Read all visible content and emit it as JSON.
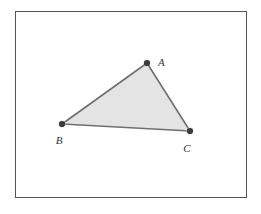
{
  "figure": {
    "type": "geometry-diagram",
    "background_color": "#ffffff",
    "frame": {
      "name": "figure-border",
      "x": 15,
      "y": 11,
      "width": 231,
      "height": 186,
      "stroke_color": "#555555",
      "stroke_width": 1,
      "fill_color": "#ffffff"
    },
    "polygon": {
      "name": "triangle-abc",
      "fill_color": "#e4e4e4",
      "stroke_color": "#6f6f6f",
      "stroke_width": 1.6,
      "points": "147,63 62,124 190,131"
    },
    "vertices": [
      {
        "id": "A",
        "label": "A",
        "x": 147,
        "y": 63,
        "label_x": 158,
        "label_y": 63,
        "dot_color": "#3a3a3a",
        "halo_color": "#b8b8b8",
        "dot_radius": 3.1,
        "halo_radius": 5.4
      },
      {
        "id": "B",
        "label": "B",
        "x": 62,
        "y": 124,
        "label_x": 59,
        "label_y": 141,
        "dot_color": "#3a3a3a",
        "halo_color": "#b8b8b8",
        "dot_radius": 3.1,
        "halo_radius": 5.4
      },
      {
        "id": "C",
        "label": "C",
        "x": 190,
        "y": 131,
        "label_x": 187,
        "label_y": 149,
        "dot_color": "#3a3a3a",
        "halo_color": "#b8b8b8",
        "dot_radius": 3.1,
        "halo_radius": 5.4
      }
    ],
    "edges": [
      {
        "id": "AB",
        "from": "A",
        "to": "B"
      },
      {
        "id": "BC",
        "from": "B",
        "to": "C"
      },
      {
        "id": "CA",
        "from": "C",
        "to": "A"
      }
    ]
  }
}
